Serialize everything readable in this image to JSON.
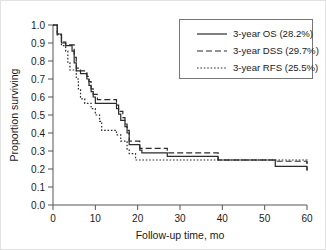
{
  "chart_data": {
    "type": "line",
    "title": "",
    "xlabel": "Follow-up time, mo",
    "ylabel": "Proportion surviving",
    "xlim": [
      0,
      60
    ],
    "ylim": [
      0.0,
      1.0
    ],
    "xticks": [
      "0",
      "10",
      "20",
      "30",
      "40",
      "50",
      "60"
    ],
    "yticks": [
      "0.0",
      "0.1",
      "0.2",
      "0.3",
      "0.4",
      "0.5",
      "0.6",
      "0.7",
      "0.8",
      "0.9",
      "1.0"
    ],
    "grid": false,
    "legend_position": "top-right",
    "curve_style": "kaplan-meier step",
    "series": [
      {
        "name": "3-year OS (28.2%)",
        "legend_label": "3-year OS (28.2%)",
        "rate_percent": 28.2,
        "dash": "solid",
        "color": "#2b2b2b",
        "points": [
          [
            0,
            1.0
          ],
          [
            1,
            1.0
          ],
          [
            1,
            0.95
          ],
          [
            2,
            0.95
          ],
          [
            2,
            0.9
          ],
          [
            3,
            0.9
          ],
          [
            3,
            0.885
          ],
          [
            4.5,
            0.885
          ],
          [
            4.5,
            0.855
          ],
          [
            5,
            0.855
          ],
          [
            5,
            0.79
          ],
          [
            5.5,
            0.79
          ],
          [
            5.5,
            0.745
          ],
          [
            6.5,
            0.745
          ],
          [
            6.5,
            0.73
          ],
          [
            8,
            0.73
          ],
          [
            8,
            0.7
          ],
          [
            8.5,
            0.7
          ],
          [
            8.5,
            0.665
          ],
          [
            9,
            0.665
          ],
          [
            9,
            0.63
          ],
          [
            9.5,
            0.63
          ],
          [
            9.5,
            0.6
          ],
          [
            10,
            0.6
          ],
          [
            10,
            0.565
          ],
          [
            15,
            0.565
          ],
          [
            15,
            0.535
          ],
          [
            15.5,
            0.535
          ],
          [
            15.5,
            0.505
          ],
          [
            16,
            0.505
          ],
          [
            16,
            0.47
          ],
          [
            17,
            0.47
          ],
          [
            17,
            0.435
          ],
          [
            17.5,
            0.435
          ],
          [
            17.5,
            0.4
          ],
          [
            18,
            0.4
          ],
          [
            18,
            0.335
          ],
          [
            20.5,
            0.335
          ],
          [
            20.5,
            0.305
          ],
          [
            21,
            0.305
          ],
          [
            21,
            0.29
          ],
          [
            27,
            0.29
          ],
          [
            27,
            0.27
          ],
          [
            39,
            0.27
          ],
          [
            39,
            0.25
          ],
          [
            52.5,
            0.25
          ],
          [
            52.5,
            0.215
          ],
          [
            60,
            0.215
          ],
          [
            60,
            0.19
          ]
        ]
      },
      {
        "name": "3-year DSS (29.7%)",
        "legend_label": "3-year DSS (29.7%)",
        "rate_percent": 29.7,
        "dash": "dashed",
        "color": "#2b2b2b",
        "points": [
          [
            0,
            1.0
          ],
          [
            1,
            1.0
          ],
          [
            1,
            0.95
          ],
          [
            2,
            0.95
          ],
          [
            2,
            0.905
          ],
          [
            3,
            0.905
          ],
          [
            3,
            0.89
          ],
          [
            5,
            0.89
          ],
          [
            5,
            0.82
          ],
          [
            5.5,
            0.82
          ],
          [
            5.5,
            0.76
          ],
          [
            6.5,
            0.76
          ],
          [
            6.5,
            0.745
          ],
          [
            8,
            0.745
          ],
          [
            8,
            0.715
          ],
          [
            8.5,
            0.715
          ],
          [
            8.5,
            0.685
          ],
          [
            9,
            0.685
          ],
          [
            9,
            0.645
          ],
          [
            9.5,
            0.645
          ],
          [
            9.5,
            0.615
          ],
          [
            10.5,
            0.615
          ],
          [
            10.5,
            0.585
          ],
          [
            15,
            0.585
          ],
          [
            15,
            0.555
          ],
          [
            15.5,
            0.555
          ],
          [
            15.5,
            0.52
          ],
          [
            16.5,
            0.52
          ],
          [
            16.5,
            0.485
          ],
          [
            17,
            0.485
          ],
          [
            17,
            0.45
          ],
          [
            17.5,
            0.45
          ],
          [
            17.5,
            0.415
          ],
          [
            18,
            0.415
          ],
          [
            18,
            0.355
          ],
          [
            20.5,
            0.355
          ],
          [
            20.5,
            0.315
          ],
          [
            27,
            0.315
          ],
          [
            27,
            0.29
          ],
          [
            39,
            0.29
          ],
          [
            39,
            0.25
          ],
          [
            52.5,
            0.25
          ],
          [
            52.5,
            0.243
          ],
          [
            60,
            0.243
          ],
          [
            60,
            0.195
          ]
        ]
      },
      {
        "name": "3-year RFS (25.5%)",
        "legend_label": "3-year RFS (25.5%)",
        "rate_percent": 25.5,
        "dash": "dotted",
        "color": "#2b2b2b",
        "points": [
          [
            0,
            1.0
          ],
          [
            1,
            1.0
          ],
          [
            1,
            0.945
          ],
          [
            2,
            0.945
          ],
          [
            2,
            0.885
          ],
          [
            3,
            0.885
          ],
          [
            3,
            0.855
          ],
          [
            3.5,
            0.855
          ],
          [
            3.5,
            0.79
          ],
          [
            4,
            0.79
          ],
          [
            4,
            0.75
          ],
          [
            5.5,
            0.75
          ],
          [
            5.5,
            0.7
          ],
          [
            6,
            0.7
          ],
          [
            6,
            0.64
          ],
          [
            6.5,
            0.64
          ],
          [
            6.5,
            0.59
          ],
          [
            7.5,
            0.59
          ],
          [
            7.5,
            0.565
          ],
          [
            9,
            0.565
          ],
          [
            9,
            0.535
          ],
          [
            10,
            0.535
          ],
          [
            10,
            0.5
          ],
          [
            11,
            0.5
          ],
          [
            11,
            0.465
          ],
          [
            11.5,
            0.465
          ],
          [
            11.5,
            0.415
          ],
          [
            15,
            0.415
          ],
          [
            15,
            0.39
          ],
          [
            16,
            0.39
          ],
          [
            16,
            0.355
          ],
          [
            17.5,
            0.355
          ],
          [
            17.5,
            0.31
          ],
          [
            18,
            0.31
          ],
          [
            18,
            0.285
          ],
          [
            19.5,
            0.285
          ],
          [
            19.5,
            0.25
          ],
          [
            60,
            0.25
          ],
          [
            60,
            0.22
          ]
        ]
      }
    ]
  },
  "axes": {
    "y_axis_title": "Proportion surviving",
    "x_axis_title": "Follow-up time, mo"
  }
}
